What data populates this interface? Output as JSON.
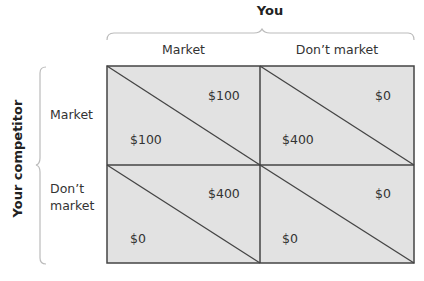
{
  "matrix": {
    "column_player": "You",
    "row_player": "Your competitor",
    "columns": [
      "Market",
      "Don’t market"
    ],
    "rows": [
      "Market",
      "Don’t\nmarket"
    ],
    "row_labels_lines": [
      [
        "Market"
      ],
      [
        "Don’t",
        "market"
      ]
    ],
    "cells": [
      [
        {
          "you": "$100",
          "competitor": "$100"
        },
        {
          "you": "$0",
          "competitor": "$400"
        }
      ],
      [
        {
          "you": "$400",
          "competitor": "$0"
        },
        {
          "you": "$0",
          "competitor": "$0"
        }
      ]
    ]
  },
  "colors": {
    "cell_fill": "#e2e2e2",
    "grid_line": "#444444",
    "bracket": "#bbbbbb"
  }
}
